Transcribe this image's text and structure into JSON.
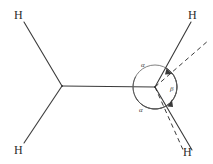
{
  "figure": {
    "width": 213,
    "height": 164,
    "background_color": "#ffffff",
    "stroke_color": "#3a3a3a",
    "label_color": "#2b2b2b"
  },
  "atoms": [
    {
      "id": "h-top-left",
      "label": "H",
      "x": 14,
      "y": 9
    },
    {
      "id": "h-bottom-left",
      "label": "H",
      "x": 14,
      "y": 144
    },
    {
      "id": "h-top-right",
      "label": "H",
      "x": 188,
      "y": 9
    },
    {
      "id": "h-bottom-right",
      "label": "H",
      "x": 183,
      "y": 146
    }
  ],
  "vertices": [
    {
      "id": "carbon-left",
      "x": 62,
      "y": 86
    },
    {
      "id": "carbon-right",
      "x": 155,
      "y": 87
    }
  ],
  "bonds": [
    {
      "id": "bond-h-top-left",
      "style": "solid",
      "x1": 24,
      "y1": 22,
      "x2": 62,
      "y2": 86
    },
    {
      "id": "bond-h-bottom-left",
      "style": "solid",
      "x1": 62,
      "y1": 86,
      "x2": 24,
      "y2": 143
    },
    {
      "id": "bond-central",
      "style": "solid",
      "x1": 62,
      "y1": 86,
      "x2": 155,
      "y2": 87
    },
    {
      "id": "bond-h-top-right",
      "style": "solid",
      "x1": 155,
      "y1": 87,
      "x2": 191,
      "y2": 22
    },
    {
      "id": "bond-h-bottom-right",
      "style": "solid",
      "x1": 155,
      "y1": 87,
      "x2": 192,
      "y2": 150
    }
  ],
  "reference_lines": [
    {
      "id": "dashed-reference-upper",
      "style": "dashed",
      "x1": 155,
      "y1": 87,
      "x2": 209,
      "y2": 40
    },
    {
      "id": "dashed-reference-lower",
      "style": "dashed",
      "x1": 155,
      "y1": 87,
      "x2": 184,
      "y2": 152
    }
  ],
  "angle_circle": {
    "id": "angle-circle",
    "center_x": 155,
    "center_y": 87,
    "radius": 22
  },
  "angle_labels": [
    {
      "id": "alpha-upper",
      "symbol": "α",
      "x": 141,
      "y": 62
    },
    {
      "id": "alpha-lower",
      "symbol": "α",
      "x": 139,
      "y": 107
    },
    {
      "id": "beta",
      "symbol": "β",
      "x": 170,
      "y": 86
    }
  ],
  "arcs": [
    {
      "id": "arc-alpha-upper",
      "from_deg": 208,
      "to_deg": 299,
      "arrow": "end"
    },
    {
      "id": "arc-alpha-lower",
      "from_deg": 152,
      "to_deg": 62,
      "arrow": "end"
    },
    {
      "id": "arc-beta",
      "from_deg": 299,
      "to_deg": 62,
      "arrow": "both"
    }
  ]
}
